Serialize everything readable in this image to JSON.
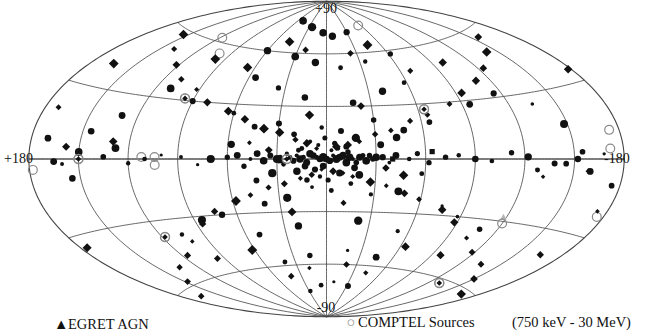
{
  "figure": {
    "type": "all-sky-map",
    "projection": "Aitoff",
    "coordinate_system": "galactic"
  },
  "axes": {
    "north_pole_label": "+90",
    "south_pole_label": "-90",
    "left_label": "+180",
    "right_label": "-180"
  },
  "legend": {
    "egret_symbol": "▲",
    "egret_label": "EGRET AGN",
    "comptel_symbol": "○",
    "comptel_label": "COMPTEL Sources",
    "energy_range": "(750  keV - 30 MeV)"
  },
  "colors": {
    "background": "#ffffff",
    "graticule": "#444444",
    "marker_fill": "#111111",
    "open_circle": "#8a8a8a",
    "faint_marker": "#b5b5b5"
  },
  "grid": {
    "meridian_step_deg": 30,
    "parallel_step_deg": 30,
    "lon_range": [
      -180,
      180
    ],
    "lat_range": [
      -90,
      90
    ]
  },
  "chart_data": {
    "type": "scatter",
    "title": "",
    "xlabel": "Galactic longitude",
    "ylabel": "Galactic latitude",
    "xlim": [
      180,
      -180
    ],
    "ylim": [
      -90,
      90
    ],
    "grid": true,
    "legend_position": "below",
    "series": [
      {
        "name": "EGRET AGN",
        "marker": "triangle",
        "color": "#b5b5b5",
        "points": [
          [
            -118,
            -28
          ]
        ]
      },
      {
        "name": "COMPTEL Sources",
        "marker": "open-circle",
        "color": "#8a8a8a",
        "points": [
          [
            118,
            62
          ],
          [
            100,
            55
          ],
          [
            96,
            31
          ],
          [
            178,
            -4
          ],
          [
            150,
            0
          ],
          [
            112,
            1
          ],
          [
            104,
            1
          ],
          [
            24,
            0
          ],
          [
            -64,
            27
          ],
          [
            -174,
            11
          ],
          [
            -172,
            4
          ],
          [
            -120,
            -31
          ],
          [
            118,
            -38
          ],
          [
            -56,
            75
          ],
          [
            -130,
            -62
          ],
          [
            104,
            -3
          ],
          [
            -176,
            -22
          ]
        ]
      },
      {
        "name": "Gamma-ray point sources (filled circles)",
        "marker": "circle",
        "color": "#111111",
        "points": [
          [
            8,
            2
          ],
          [
            6,
            1
          ],
          [
            4,
            0
          ],
          [
            2,
            1
          ],
          [
            0,
            0
          ],
          [
            -2,
            -1
          ],
          [
            -4,
            2
          ],
          [
            -6,
            0
          ],
          [
            -8,
            1
          ],
          [
            10,
            3
          ],
          [
            12,
            -2
          ],
          [
            14,
            1
          ],
          [
            16,
            0
          ],
          [
            18,
            2
          ],
          [
            20,
            -1
          ],
          [
            22,
            1
          ],
          [
            24,
            3
          ],
          [
            -10,
            2
          ],
          [
            -12,
            -2
          ],
          [
            -14,
            1
          ],
          [
            -16,
            0
          ],
          [
            -18,
            -2
          ],
          [
            -20,
            1
          ],
          [
            -22,
            2
          ],
          [
            26,
            -3
          ],
          [
            28,
            1
          ],
          [
            30,
            0
          ],
          [
            -24,
            -1
          ],
          [
            -26,
            2
          ],
          [
            -28,
            0
          ],
          [
            -30,
            1
          ],
          [
            5,
            8
          ],
          [
            10,
            10
          ],
          [
            15,
            6
          ],
          [
            -5,
            9
          ],
          [
            -12,
            7
          ],
          [
            -18,
            12
          ],
          [
            20,
            14
          ],
          [
            -8,
            -8
          ],
          [
            4,
            -10
          ],
          [
            12,
            -12
          ],
          [
            -20,
            -9
          ],
          [
            18,
            -7
          ],
          [
            -15,
            -14
          ],
          [
            34,
            2
          ],
          [
            38,
            -1
          ],
          [
            42,
            3
          ],
          [
            46,
            0
          ],
          [
            -34,
            1
          ],
          [
            -38,
            -2
          ],
          [
            -42,
            2
          ],
          [
            50,
            -4
          ],
          [
            54,
            2
          ],
          [
            -50,
            0
          ],
          [
            -55,
            3
          ],
          [
            60,
            1
          ],
          [
            -62,
            -2
          ],
          [
            70,
            0
          ],
          [
            -72,
            1
          ],
          [
            78,
            -3
          ],
          [
            -80,
            2
          ],
          [
            88,
            1
          ],
          [
            -90,
            0
          ],
          [
            100,
            2
          ],
          [
            -100,
            -1
          ],
          [
            110,
            0
          ],
          [
            -112,
            3
          ],
          [
            120,
            -2
          ],
          [
            -122,
            1
          ],
          [
            135,
            1
          ],
          [
            -138,
            -2
          ],
          [
            150,
            3
          ],
          [
            -152,
            0
          ],
          [
            165,
            -1
          ],
          [
            -168,
            2
          ],
          [
            30,
            20
          ],
          [
            -30,
            22
          ],
          [
            45,
            18
          ],
          [
            -48,
            16
          ],
          [
            60,
            25
          ],
          [
            -65,
            20
          ],
          [
            25,
            -22
          ],
          [
            -28,
            -20
          ],
          [
            40,
            -25
          ],
          [
            -45,
            -18
          ],
          [
            70,
            -30
          ],
          [
            -75,
            -25
          ],
          [
            15,
            35
          ],
          [
            -18,
            32
          ],
          [
            35,
            40
          ],
          [
            -40,
            38
          ],
          [
            55,
            45
          ],
          [
            -58,
            42
          ],
          [
            20,
            -38
          ],
          [
            -22,
            -35
          ],
          [
            50,
            -42
          ],
          [
            -52,
            -40
          ],
          [
            90,
            30
          ],
          [
            -95,
            28
          ],
          [
            110,
            35
          ],
          [
            -115,
            32
          ],
          [
            130,
            20
          ],
          [
            -135,
            25
          ],
          [
            85,
            -32
          ],
          [
            -88,
            -30
          ],
          [
            105,
            -38
          ],
          [
            -108,
            -35
          ],
          [
            10,
            55
          ],
          [
            -12,
            52
          ],
          [
            30,
            58
          ],
          [
            -35,
            55
          ],
          [
            60,
            60
          ],
          [
            -62,
            58
          ],
          [
            15,
            -55
          ],
          [
            -18,
            -52
          ],
          [
            40,
            -58
          ],
          [
            -45,
            -55
          ],
          [
            5,
            72
          ],
          [
            -8,
            70
          ],
          [
            25,
            75
          ],
          [
            -30,
            72
          ],
          [
            50,
            78
          ],
          [
            8,
            -72
          ],
          [
            -10,
            -70
          ],
          [
            28,
            -75
          ],
          [
            -32,
            -72
          ],
          [
            155,
            -8
          ],
          [
            -160,
            -5
          ],
          [
            170,
            8
          ],
          [
            -175,
            -10
          ],
          [
            145,
            12
          ],
          [
            -148,
            15
          ],
          [
            2,
            -4
          ],
          [
            -3,
            5
          ],
          [
            7,
            -6
          ],
          [
            -7,
            6
          ],
          [
            13,
            -4
          ],
          [
            -13,
            4
          ],
          [
            17,
            5
          ],
          [
            -17,
            -5
          ],
          [
            1,
            12
          ],
          [
            -1,
            -12
          ],
          [
            3,
            18
          ],
          [
            -3,
            -18
          ],
          [
            9,
            -16
          ],
          [
            -9,
            16
          ],
          [
            33,
            -8
          ],
          [
            -33,
            8
          ],
          [
            43,
            -12
          ],
          [
            -43,
            12
          ],
          [
            58,
            8
          ],
          [
            -58,
            -8
          ],
          [
            -145,
            -2
          ],
          [
            -155,
            3
          ],
          [
            160,
            -2
          ],
          [
            128,
            5
          ],
          [
            -128,
            -5
          ]
        ]
      },
      {
        "name": "Gamma-ray point sources (filled diamonds)",
        "marker": "diamond",
        "color": "#111111",
        "points": [
          [
            3,
            -6
          ],
          [
            -4,
            -7
          ],
          [
            9,
            -9
          ],
          [
            -10,
            -8
          ],
          [
            16,
            -11
          ],
          [
            -16,
            -10
          ],
          [
            6,
            6
          ],
          [
            -6,
            7
          ],
          [
            12,
            9
          ],
          [
            -13,
            8
          ],
          [
            19,
            11
          ],
          [
            -20,
            10
          ],
          [
            26,
            -14
          ],
          [
            -27,
            -13
          ],
          [
            36,
            -16
          ],
          [
            -37,
            -15
          ],
          [
            29,
            15
          ],
          [
            -30,
            14
          ],
          [
            39,
            17
          ],
          [
            -40,
            16
          ],
          [
            48,
            -20
          ],
          [
            -49,
            -19
          ],
          [
            58,
            -23
          ],
          [
            -59,
            -22
          ],
          [
            52,
            22
          ],
          [
            -53,
            21
          ],
          [
            64,
            26
          ],
          [
            -65,
            24
          ],
          [
            74,
            -28
          ],
          [
            -76,
            -27
          ],
          [
            86,
            -34
          ],
          [
            -88,
            -33
          ],
          [
            80,
            30
          ],
          [
            -82,
            29
          ],
          [
            92,
            36
          ],
          [
            -94,
            34
          ],
          [
            102,
            -42
          ],
          [
            -104,
            -40
          ],
          [
            116,
            -48
          ],
          [
            -118,
            -46
          ],
          [
            108,
            40
          ],
          [
            -110,
            39
          ],
          [
            122,
            46
          ],
          [
            -124,
            44
          ],
          [
            134,
            -52
          ],
          [
            -136,
            -50
          ],
          [
            148,
            -58
          ],
          [
            -150,
            -56
          ],
          [
            140,
            52
          ],
          [
            -142,
            50
          ],
          [
            154,
            58
          ],
          [
            -156,
            56
          ],
          [
            166,
            -64
          ],
          [
            -168,
            -62
          ],
          [
            172,
            20
          ],
          [
            -174,
            -20
          ],
          [
            22,
            62
          ],
          [
            -24,
            60
          ],
          [
            44,
            66
          ],
          [
            -46,
            64
          ],
          [
            18,
            -62
          ],
          [
            -20,
            -60
          ],
          [
            42,
            -66
          ],
          [
            -44,
            -64
          ],
          [
            66,
            50
          ],
          [
            -68,
            48
          ],
          [
            98,
            52
          ],
          [
            -99,
            50
          ],
          [
            62,
            -50
          ],
          [
            -64,
            -48
          ],
          [
            96,
            -52
          ],
          [
            -97,
            -50
          ],
          [
            11,
            25
          ],
          [
            -11,
            -25
          ],
          [
            23,
            -30
          ],
          [
            -23,
            30
          ],
          [
            35,
            5
          ],
          [
            -36,
            -5
          ],
          [
            47,
            9
          ],
          [
            -47,
            -9
          ],
          [
            130,
            8
          ],
          [
            -132,
            -8
          ],
          [
            158,
            5
          ],
          [
            -159,
            -5
          ],
          [
            176,
            -35
          ],
          [
            -178,
            35
          ],
          [
            165,
            40
          ],
          [
            -166,
            -40
          ]
        ]
      },
      {
        "name": "Gamma-ray point sources (filled squares)",
        "marker": "square",
        "color": "#111111",
        "points": [
          [
            -64,
            4
          ],
          [
            28,
            -1
          ],
          [
            -40,
            0
          ]
        ]
      },
      {
        "name": "Circled sources (identified)",
        "marker": "circled",
        "color": "#111111",
        "points": [
          [
            96,
            31
          ],
          [
            -64,
            27
          ],
          [
            118,
            -38
          ],
          [
            -130,
            -62
          ],
          [
            150,
            0
          ],
          [
            24,
            0
          ]
        ]
      }
    ]
  }
}
